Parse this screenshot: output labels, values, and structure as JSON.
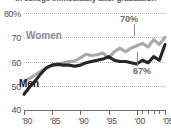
{
  "chart_data": {
    "type": "line",
    "title": "in college immediately after graduation",
    "xlabel": "",
    "ylabel": "",
    "ylim": [
      40,
      80
    ],
    "yticks": [
      "80%",
      "70",
      "60",
      "50",
      "40"
    ],
    "ytick_values": [
      80,
      70,
      60,
      50,
      40
    ],
    "grid": true,
    "legend": "inline",
    "x": [
      1980,
      1981,
      1982,
      1983,
      1984,
      1985,
      1986,
      1987,
      1988,
      1989,
      1990,
      1991,
      1992,
      1993,
      1994,
      1995,
      1996,
      1997,
      1998,
      1999,
      2000,
      2001,
      2002,
      2003,
      2004,
      2005
    ],
    "xticks": [
      "'80",
      "'85",
      "'90",
      "'95",
      "'00",
      "'05"
    ],
    "xtick_values": [
      1980,
      1985,
      1990,
      1995,
      2000,
      2005
    ],
    "series": [
      {
        "name": "Women",
        "color": "#a9a9a9",
        "values": [
          51.8,
          53.0,
          54.5,
          56.0,
          57.3,
          58.5,
          59.0,
          59.5,
          60.0,
          60.2,
          61.5,
          63.0,
          62.5,
          62.8,
          63.5,
          61.5,
          64.0,
          65.5,
          64.0,
          65.5,
          66.5,
          67.5,
          66.0,
          69.0,
          67.0,
          70.0
        ]
      },
      {
        "name": "Men",
        "color": "#262626",
        "values": [
          46.5,
          49.5,
          52.0,
          55.0,
          57.5,
          58.5,
          58.8,
          58.5,
          58.5,
          58.0,
          58.5,
          59.5,
          60.0,
          60.5,
          61.0,
          62.0,
          60.5,
          60.0,
          60.0,
          59.5,
          59.0,
          60.5,
          59.5,
          62.0,
          60.5,
          67.0
        ]
      }
    ],
    "annotations": [
      {
        "text": "70%",
        "value": 70,
        "series": "Women",
        "x": 2005
      },
      {
        "text": "67%",
        "value": 67,
        "series": "Men",
        "x": 2005
      }
    ]
  }
}
